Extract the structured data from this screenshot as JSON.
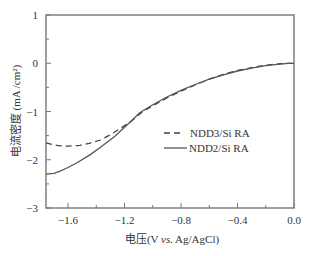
{
  "chart_data": {
    "type": "line",
    "title": "",
    "xlabel": "电压(V vs. Ag/AgCl)",
    "xlabel_parts": {
      "prefix": "电压(V ",
      "italic": "vs.",
      "suffix": " Ag/AgCl)"
    },
    "ylabel": "电流密度 (mA /cm²)",
    "xlim": [
      -1.756,
      0.0
    ],
    "ylim": [
      -3,
      1
    ],
    "x_ticks": [
      -1.6,
      -1.2,
      -0.8,
      -0.4,
      0.0
    ],
    "x_tick_labels": [
      "−1.6",
      "−1.2",
      "−0.8",
      "−0.4",
      "0.0"
    ],
    "x_minor_ticks": [
      -1.4,
      -1.0,
      -0.6,
      -0.2
    ],
    "y_ticks": [
      1,
      0,
      -1,
      -2,
      -3
    ],
    "y_tick_labels": [
      "1",
      "0",
      "−1",
      "−2",
      "−3"
    ],
    "y_minor_ticks": [
      0.5,
      -0.5,
      -1.5,
      -2.5
    ],
    "grid": false,
    "legend_position": "center-right",
    "series": [
      {
        "name": "NDD3/Si RA",
        "style": "dashed",
        "color": "#444444",
        "x": [
          -1.756,
          -1.7,
          -1.66,
          -1.6,
          -1.515,
          -1.45,
          -1.37,
          -1.3,
          -1.23,
          -1.16,
          -1.07,
          -1.0,
          -0.9,
          -0.8,
          -0.7,
          -0.6,
          -0.5,
          -0.4,
          -0.3,
          -0.2,
          -0.1,
          -0.04,
          0.0
        ],
        "y": [
          -1.65,
          -1.69,
          -1.71,
          -1.72,
          -1.7,
          -1.66,
          -1.59,
          -1.48,
          -1.35,
          -1.22,
          -1.0,
          -0.88,
          -0.72,
          -0.58,
          -0.45,
          -0.33,
          -0.23,
          -0.15,
          -0.09,
          -0.04,
          -0.01,
          0.0,
          0.0
        ]
      },
      {
        "name": "NDD2/Si RA",
        "style": "solid",
        "color": "#555555",
        "x": [
          -1.756,
          -1.7,
          -1.66,
          -1.6,
          -1.53,
          -1.445,
          -1.37,
          -1.27,
          -1.16,
          -1.09,
          -1.0,
          -0.9,
          -0.8,
          -0.7,
          -0.6,
          -0.5,
          -0.4,
          -0.3,
          -0.2,
          -0.1,
          -0.04,
          0.0
        ],
        "y": [
          -2.3,
          -2.28,
          -2.24,
          -2.16,
          -2.05,
          -1.9,
          -1.74,
          -1.52,
          -1.22,
          -1.02,
          -0.86,
          -0.7,
          -0.56,
          -0.44,
          -0.33,
          -0.24,
          -0.16,
          -0.1,
          -0.05,
          -0.02,
          0.0,
          0.0
        ]
      }
    ]
  }
}
